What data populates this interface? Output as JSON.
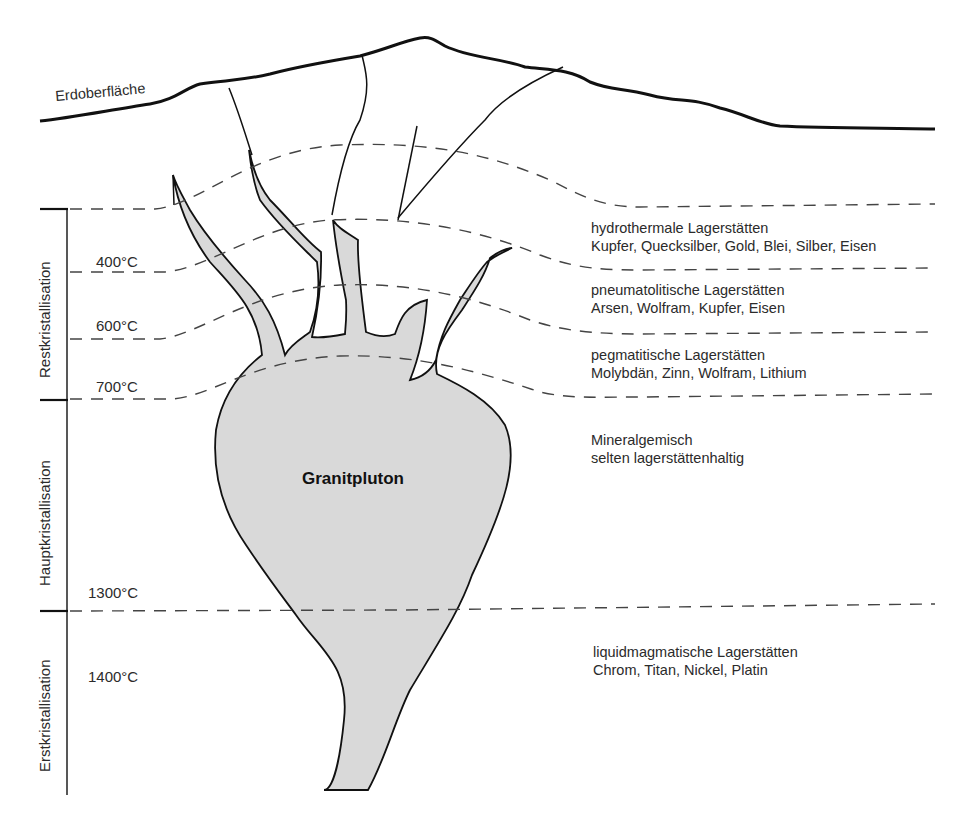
{
  "title": "Granitpluton",
  "surface_label": "Erdoberfläche",
  "pluton_label": "Granitpluton",
  "colors": {
    "pluton_fill": "#d9d9d9",
    "line": "#111111",
    "dash": "#444444",
    "text": "#2b2b2b"
  },
  "phases": [
    {
      "label": "Restkristallisation",
      "range": [
        "top",
        "700°C"
      ]
    },
    {
      "label": "Hauptkristallisation",
      "range": [
        "700°C",
        "1300°C"
      ]
    },
    {
      "label": "Erstkristallisation",
      "range": [
        "1300°C",
        "bottom"
      ]
    }
  ],
  "temperatures": [
    "400°C",
    "600°C",
    "700°C",
    "1300°C",
    "1400°C"
  ],
  "zones": [
    {
      "name": "hydrothermale Lagerstätten",
      "minerals": "Kupfer, Quecksilber, Gold, Blei, Silber, Eisen"
    },
    {
      "name": "pneumatolitische Lagerstätten",
      "minerals": "Arsen, Wolfram, Kupfer, Eisen"
    },
    {
      "name": "pegmatitische Lagerstätten",
      "minerals": "Molybdän, Zinn, Wolfram, Lithium"
    },
    {
      "name": "Mineralgemisch",
      "minerals": "selten lagerstättenhaltig"
    },
    {
      "name": "liquidmagmatische Lagerstätten",
      "minerals": "Chrom, Titan, Nickel, Platin"
    }
  ]
}
